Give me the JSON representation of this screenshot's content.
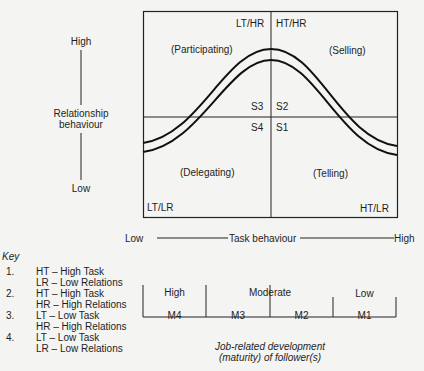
{
  "y_axis": {
    "high": "High",
    "label_line1": "Relationship",
    "label_line2": "behaviour",
    "low": "Low"
  },
  "quadrants": {
    "top_left_corner": "LT/HR",
    "top_right_corner": "HT/HR",
    "bottom_left_corner": "LT/LR",
    "bottom_right_corner": "HT/LR",
    "participating": "(Participating)",
    "selling": "(Selling)",
    "delegating": "(Delegating)",
    "telling": "(Telling)",
    "s3": "S3",
    "s2": "S2",
    "s4": "S4",
    "s1": "S1"
  },
  "x_axis": {
    "low": "Low",
    "label": "Task behaviour",
    "high": "High"
  },
  "key": {
    "title": "Key",
    "items": [
      {
        "num": "1.",
        "line1": "HT – High Task",
        "line2": "LR – Low Relations"
      },
      {
        "num": "2.",
        "line1": "HT – High Task",
        "line2": "HR – High Relations"
      },
      {
        "num": "3.",
        "line1": "LT – Low Task",
        "line2": "HR – High Relations"
      },
      {
        "num": "4.",
        "line1": "LT – Low Task",
        "line2": "LR – Low Relations"
      }
    ]
  },
  "maturity": {
    "high": "High",
    "moderate": "Moderate",
    "low": "Low",
    "cells": [
      "M4",
      "M3",
      "M2",
      "M1"
    ],
    "caption_line1": "Job-related development",
    "caption_line2": "(maturity) of follower(s)"
  }
}
